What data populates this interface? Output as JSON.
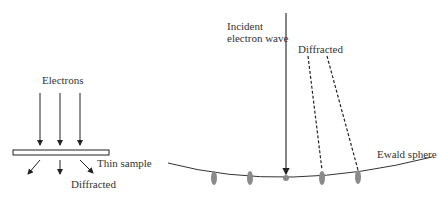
{
  "left_panel": {
    "electrons_label": "Electrons",
    "sample_label": "Thin sample",
    "diffracted_label": "Diffracted"
  },
  "right_panel": {
    "incident_label_line1": "Incident",
    "incident_label_line2": "electron wave",
    "diffracted_label": "Diffracted",
    "ewald_label": "Ewald sphere"
  },
  "colors": {
    "line": "#222222",
    "spot": "#8a8a8a",
    "sample_fill": "#ffffff"
  }
}
